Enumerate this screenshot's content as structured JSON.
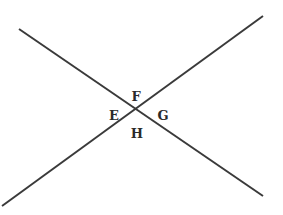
{
  "diagram": {
    "type": "intersecting-lines",
    "stroke_color": "#3a3a3a",
    "stroke_width": 2,
    "lines": [
      {
        "name": "line-1",
        "x1": 19,
        "y1": 29,
        "x2": 263,
        "y2": 196
      },
      {
        "name": "line-2",
        "x1": 2,
        "y1": 206,
        "x2": 263,
        "y2": 16
      }
    ],
    "intersection": {
      "x": 134,
      "y": 108
    },
    "labels": [
      {
        "text": "F",
        "x": 136,
        "y": 96
      },
      {
        "text": "E",
        "x": 114,
        "y": 115
      },
      {
        "text": "G",
        "x": 163,
        "y": 115
      },
      {
        "text": "H",
        "x": 137,
        "y": 133
      }
    ]
  }
}
